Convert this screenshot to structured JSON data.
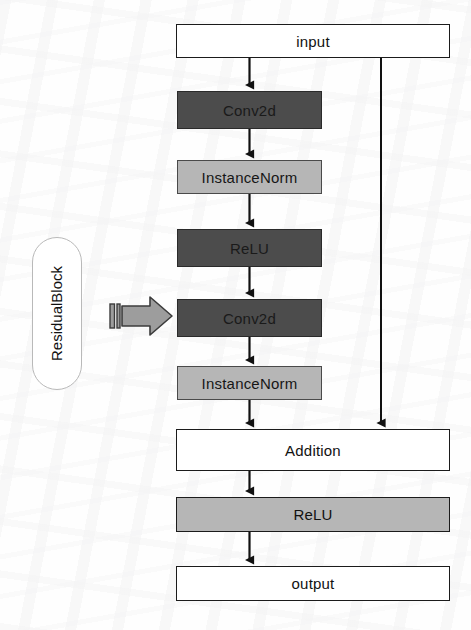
{
  "diagram": {
    "title": "ResidualBlock",
    "type": "flowchart",
    "group": {
      "label": "ResidualBlock",
      "orientation": "vertical-text",
      "pointer_icon": "block-arrow-right-icon"
    },
    "nodes": [
      {
        "id": "input",
        "label": "input",
        "style": "outline",
        "fill": "#ffffff",
        "x": 176,
        "y": 24,
        "w": 274,
        "h": 34
      },
      {
        "id": "conv2d-1",
        "label": "Conv2d",
        "style": "dark",
        "fill": "#4c4c4c",
        "x": 177,
        "y": 91,
        "w": 145,
        "h": 38
      },
      {
        "id": "instancenorm-1",
        "label": "InstanceNorm",
        "style": "light",
        "fill": "#b6b6b6",
        "x": 177,
        "y": 160,
        "w": 145,
        "h": 34
      },
      {
        "id": "relu-1",
        "label": "ReLU",
        "style": "dark",
        "fill": "#4c4c4c",
        "x": 177,
        "y": 229,
        "w": 145,
        "h": 38
      },
      {
        "id": "conv2d-2",
        "label": "Conv2d",
        "style": "dark",
        "fill": "#4c4c4c",
        "x": 177,
        "y": 299,
        "w": 145,
        "h": 38
      },
      {
        "id": "instancenorm-2",
        "label": "InstanceNorm",
        "style": "light",
        "fill": "#b6b6b6",
        "x": 177,
        "y": 366,
        "w": 145,
        "h": 34
      },
      {
        "id": "addition",
        "label": "Addition",
        "style": "outline",
        "fill": "#ffffff",
        "x": 176,
        "y": 429,
        "w": 274,
        "h": 42
      },
      {
        "id": "relu-2",
        "label": "ReLU",
        "style": "wide-light",
        "fill": "#b6b6b6",
        "x": 176,
        "y": 497,
        "w": 274,
        "h": 35
      },
      {
        "id": "output",
        "label": "output",
        "style": "outline",
        "fill": "#ffffff",
        "x": 176,
        "y": 566,
        "w": 274,
        "h": 35
      }
    ],
    "edges": [
      {
        "from": "input",
        "to": "conv2d-1",
        "kind": "arrow"
      },
      {
        "from": "conv2d-1",
        "to": "instancenorm-1",
        "kind": "arrow"
      },
      {
        "from": "instancenorm-1",
        "to": "relu-1",
        "kind": "arrow"
      },
      {
        "from": "relu-1",
        "to": "conv2d-2",
        "kind": "arrow"
      },
      {
        "from": "conv2d-2",
        "to": "instancenorm-2",
        "kind": "arrow"
      },
      {
        "from": "instancenorm-2",
        "to": "addition",
        "kind": "arrow"
      },
      {
        "from": "input",
        "to": "addition",
        "kind": "skip-connection"
      },
      {
        "from": "addition",
        "to": "relu-2",
        "kind": "arrow"
      },
      {
        "from": "relu-2",
        "to": "output",
        "kind": "arrow"
      }
    ],
    "colors": {
      "dark_block": "#4c4c4c",
      "light_block": "#b6b6b6",
      "outline_block": "#ffffff",
      "stroke": "#1b1b1b",
      "pointer_arrow": "#9a9a9a"
    }
  }
}
